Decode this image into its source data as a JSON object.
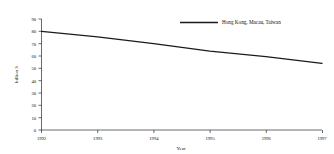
{
  "chart_data": {
    "type": "line",
    "title": "",
    "subtitle": "",
    "xlabel": "Year",
    "ylabel": "billion $",
    "x": [
      1992,
      1993,
      1994,
      1995,
      1996,
      1997
    ],
    "categories": [
      "1992",
      "1993",
      "1994",
      "1995",
      "1996",
      "1997"
    ],
    "series": [
      {
        "name": "Hong Kong, Macau, Taiwan",
        "color": "#1a1a1a",
        "values": [
          80,
          75.5,
          70,
          64,
          59.5,
          54
        ]
      }
    ],
    "xlim": [
      1992,
      1997
    ],
    "ylim": [
      0,
      90
    ],
    "ytick_labels": [
      "0",
      "10",
      "20",
      "30",
      "40",
      "50",
      "60",
      "70",
      "80",
      "90"
    ],
    "ytick_values": [
      0,
      10,
      20,
      30,
      40,
      50,
      60,
      70,
      80,
      90
    ],
    "xtick_labels": [
      "1992",
      "1993",
      "1994",
      "1995",
      "1996",
      "1997"
    ],
    "grid": false,
    "legend_position": "top-right",
    "legend_entries": [
      "Hong Kong, Macau, Taiwan"
    ]
  },
  "axes": {
    "y_title": "billion $",
    "x_title": "Year"
  },
  "legend": {
    "entry_0_label": "Hong Kong, Macau, Taiwan"
  },
  "yticks": {
    "t0": "90",
    "t1": "80",
    "t2": "70",
    "t3": "60",
    "t4": "50",
    "t5": "40",
    "t6": "30",
    "t7": "20",
    "t8": "10",
    "t9": "0"
  },
  "xticks": {
    "t0": "1992",
    "t1": "1993",
    "t2": "1994",
    "t3": "1995",
    "t4": "1996",
    "t5": "1997"
  },
  "colors": {
    "series": "#1a1a1a",
    "axis": "#2b2b2b",
    "background": "#ffffff"
  }
}
